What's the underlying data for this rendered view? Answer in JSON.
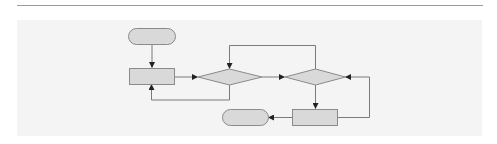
{
  "diagram": {
    "type": "flowchart",
    "colors": {
      "shape_fill": "#d9d9d9",
      "shape_stroke": "#8a8a8a",
      "connector": "#7a7a7a",
      "arrowhead": "#222222",
      "panel": "#f4f4f4",
      "rule": "#9a9a9a"
    },
    "nodes": [
      {
        "id": "start",
        "shape": "terminator",
        "label": ""
      },
      {
        "id": "process1",
        "shape": "process",
        "label": ""
      },
      {
        "id": "decision1",
        "shape": "decision",
        "label": ""
      },
      {
        "id": "decision2",
        "shape": "decision",
        "label": ""
      },
      {
        "id": "process2",
        "shape": "process",
        "label": ""
      },
      {
        "id": "end",
        "shape": "terminator",
        "label": ""
      }
    ],
    "edges": [
      {
        "from": "start",
        "to": "process1"
      },
      {
        "from": "process1",
        "to": "decision1"
      },
      {
        "from": "decision1",
        "to": "process1",
        "route": "loop-below"
      },
      {
        "from": "decision1",
        "to": "decision2"
      },
      {
        "from": "decision2",
        "to": "decision1",
        "route": "loop-above"
      },
      {
        "from": "decision2",
        "to": "process2"
      },
      {
        "from": "process2",
        "to": "decision2",
        "route": "loop-right"
      },
      {
        "from": "process2",
        "to": "end"
      }
    ]
  }
}
